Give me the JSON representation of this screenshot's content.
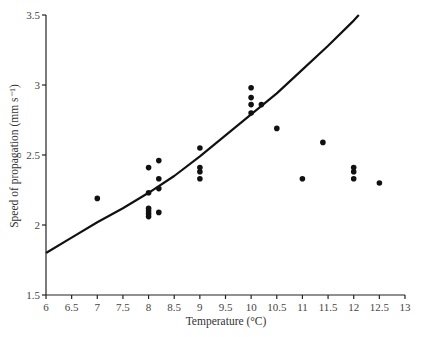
{
  "chart_data": {
    "type": "scatter",
    "title": "",
    "xlabel": "Temperature (°C)",
    "ylabel": "Speed of propagation (mm s⁻¹)",
    "xlim": [
      6,
      13
    ],
    "ylim": [
      1.5,
      3.5
    ],
    "xticks": [
      "6",
      "6.5",
      "7",
      "7.5",
      "8",
      "8.5",
      "9",
      "9.5",
      "10",
      "10.5",
      "11",
      "11.5",
      "12",
      "12.5",
      "13"
    ],
    "yticks": [
      "1.5",
      "2",
      "2.5",
      "3",
      "3.5"
    ],
    "grid": false,
    "legend": null,
    "series": [
      {
        "name": "observations",
        "kind": "scatter",
        "points": [
          [
            7.0,
            2.19
          ],
          [
            8.0,
            2.41
          ],
          [
            8.0,
            2.23
          ],
          [
            8.0,
            2.12
          ],
          [
            8.0,
            2.1
          ],
          [
            8.0,
            2.08
          ],
          [
            8.0,
            2.06
          ],
          [
            8.2,
            2.46
          ],
          [
            8.2,
            2.33
          ],
          [
            8.2,
            2.26
          ],
          [
            8.2,
            2.09
          ],
          [
            9.0,
            2.55
          ],
          [
            9.0,
            2.41
          ],
          [
            9.0,
            2.38
          ],
          [
            9.0,
            2.33
          ],
          [
            10.0,
            2.98
          ],
          [
            10.0,
            2.91
          ],
          [
            10.0,
            2.86
          ],
          [
            10.0,
            2.8
          ],
          [
            10.2,
            2.86
          ],
          [
            10.5,
            2.69
          ],
          [
            11.0,
            2.33
          ],
          [
            11.4,
            2.59
          ],
          [
            12.0,
            2.41
          ],
          [
            12.0,
            2.38
          ],
          [
            12.0,
            2.33
          ],
          [
            12.5,
            2.3
          ]
        ]
      },
      {
        "name": "fitted curve",
        "kind": "line",
        "points": [
          [
            6.0,
            1.8
          ],
          [
            6.5,
            1.91
          ],
          [
            7.0,
            2.02
          ],
          [
            7.5,
            2.12
          ],
          [
            8.0,
            2.23
          ],
          [
            8.5,
            2.35
          ],
          [
            9.0,
            2.49
          ],
          [
            9.5,
            2.64
          ],
          [
            10.0,
            2.79
          ],
          [
            10.5,
            2.94
          ],
          [
            11.0,
            3.11
          ],
          [
            11.5,
            3.28
          ],
          [
            12.0,
            3.46
          ],
          [
            12.1,
            3.5
          ]
        ]
      }
    ]
  }
}
